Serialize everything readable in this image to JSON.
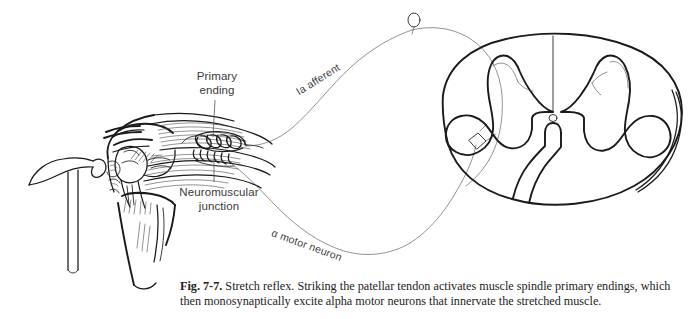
{
  "figure": {
    "title": "Stretch reflex",
    "background_color": "#ffffff",
    "ink_color": "#1a1a1a",
    "label_color": "#3a3a3a"
  },
  "labels": {
    "primary_ending": "Primary\nending",
    "neuromuscular_junction": "Neuromuscular\njunction",
    "ia_afferent": "Ia afferent",
    "alpha_motor_neuron": "α motor neuron"
  },
  "caption": {
    "figure_number": "Fig. 7-7.",
    "text": " Stretch reflex. Striking the patellar tendon activates muscle spindle primary endings, which then monosynaptically excite alpha motor neurons that innervate the stretched muscle."
  },
  "icons": {
    "reflex_hammer": "reflex-hammer-icon",
    "muscle_spindle": "muscle-spindle-icon",
    "dorsal_root_ganglion": "dorsal-root-ganglion-icon",
    "motor_neuron_soma": "motor-neuron-soma-icon",
    "central_canal": "central-canal-icon"
  }
}
